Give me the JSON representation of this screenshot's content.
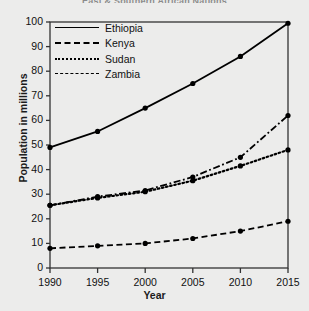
{
  "chart_data": {
    "type": "line",
    "title": "East & Southern African Nations",
    "xlabel": "Year",
    "ylabel": "Population in millions",
    "x": [
      1990,
      1995,
      2000,
      2005,
      2010,
      2015
    ],
    "xtick_labels": [
      "1990",
      "1995",
      "2000",
      "2005",
      "2010",
      "2015"
    ],
    "ytick_labels": [
      "0",
      "10",
      "20",
      "30",
      "40",
      "50",
      "60",
      "70",
      "80",
      "90",
      "100"
    ],
    "yticks": [
      0,
      10,
      20,
      30,
      40,
      50,
      60,
      70,
      80,
      90,
      100
    ],
    "ylim": [
      0,
      100
    ],
    "xlim": [
      1990,
      2015
    ],
    "grid": false,
    "legend_position": "upper-left-inside",
    "series": [
      {
        "name": "Ethiopia",
        "style": "solid",
        "marker": "circle",
        "values": [
          49,
          55.5,
          65,
          75,
          86,
          99.5
        ]
      },
      {
        "name": "Kenya",
        "style": "dashdot",
        "marker": "circle",
        "values": [
          25.5,
          29,
          31.5,
          37,
          45,
          62
        ]
      },
      {
        "name": "Sudan",
        "style": "dotted",
        "marker": "circle",
        "values": [
          25.5,
          28.5,
          31,
          35.5,
          41.5,
          48
        ]
      },
      {
        "name": "Zambia",
        "style": "dashed",
        "marker": "circle",
        "values": [
          8,
          9,
          10,
          12,
          15,
          19
        ]
      }
    ]
  },
  "colors": {
    "ink": "#000000",
    "background": "#ececeb",
    "axis": "#333333"
  }
}
